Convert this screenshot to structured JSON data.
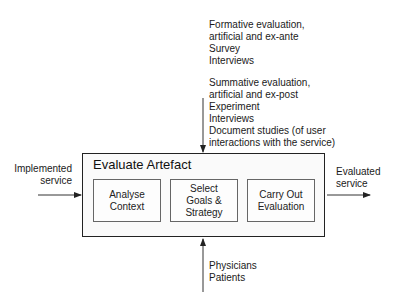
{
  "diagram": {
    "process": {
      "title": "Evaluate Artefact",
      "steps": [
        {
          "label": "Analyse\nContext"
        },
        {
          "label": "Select\nGoals &\nStrategy"
        },
        {
          "label": "Carry Out\nEvaluation"
        }
      ]
    },
    "input": {
      "label": "Implemented\nservice"
    },
    "output": {
      "label": "Evaluated\nservice"
    },
    "controls": {
      "formative": [
        "Formative evaluation,",
        "artificial and ex-ante",
        "Survey",
        "Interviews"
      ],
      "summative": [
        "Summative evaluation,",
        "artificial and ex-post",
        "Experiment",
        "Interviews",
        "Document studies (of user",
        "interactions with the service)"
      ]
    },
    "mechanisms": [
      "Physicians",
      "Patients"
    ],
    "colors": {
      "line": "#222222",
      "box_fill": "#fafafa"
    }
  }
}
